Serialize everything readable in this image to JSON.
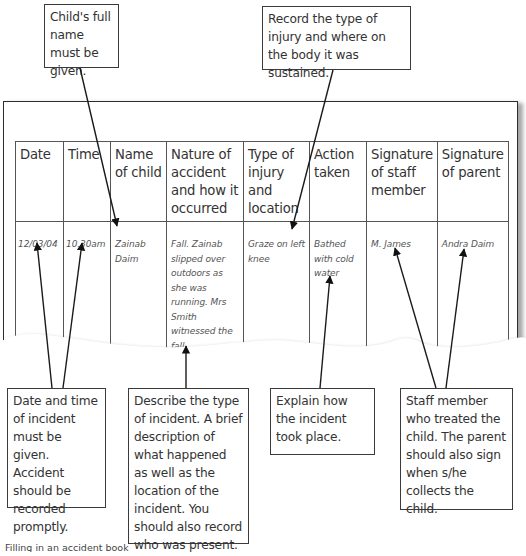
{
  "callouts": {
    "child_name": "Child's full name must be given.",
    "injury": "Record the type of injury and where on the body it was sustained.",
    "date_time": "Date and time of incident must be given. Accident should be recorded promptly.",
    "describe": "Describe the type of incident. A brief description of what happened as well as the location of the incident. You should also record who was present.",
    "explain": "Explain how the incident took place.",
    "staff": "Staff member who treated the child. The parent should also sign when s/he collects the child."
  },
  "table": {
    "headers": [
      "Date",
      "Time",
      "Name of child",
      "Nature of accident and how it occurred",
      "Type of injury and location",
      "Action taken",
      "Signature of staff member",
      "Signature of parent"
    ],
    "rows": [
      {
        "date": "12/03/04",
        "time": "10.30am",
        "name": "Zainab Daim",
        "nature": "Fall. Zainab slipped over outdoors as she was running. Mrs Smith witnessed the fall.",
        "injury": "Graze on left knee",
        "action": "Bathed with cold water",
        "staff_signature": "M. James",
        "parent_signature": "Andra Daim"
      }
    ]
  },
  "caption": "Filling in an accident book"
}
